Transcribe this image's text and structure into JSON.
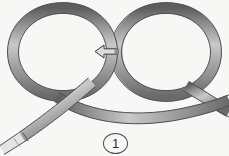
{
  "figure": {
    "step_number": "1",
    "background_color": "#f7f7f5",
    "band": {
      "material_label": "flat woven band",
      "fill_color": "#9a9a9a",
      "highlight_color": "#d2d2d2",
      "edge_color": "#4a4a4a",
      "tip_color": "#e8e8e8",
      "width_px": 11
    },
    "arrow": {
      "semantic": "direction-arrow",
      "direction": "left",
      "fill_color": "#dcdcdc",
      "outline_color": "#3a3a3a",
      "x": 95,
      "y": 45,
      "width": 23,
      "height": 13
    },
    "loops": [
      {
        "name": "left-loop",
        "center_x": 63,
        "center_y": 52,
        "radius": 46
      },
      {
        "name": "right-loop",
        "center_x": 166,
        "center_y": 52,
        "radius": 46
      }
    ],
    "free_end": {
      "name": "band-free-end",
      "position": "bottom-left",
      "x": 2,
      "y": 136
    }
  }
}
